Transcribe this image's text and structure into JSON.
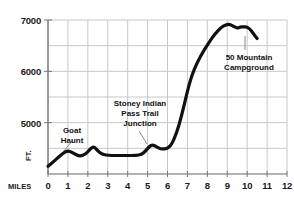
{
  "chart_data": {
    "type": "line",
    "title": "",
    "subtitle": "",
    "xlabel": "MILES",
    "ylabel": "FT.",
    "xlim": [
      0,
      12
    ],
    "ylim": [
      4000,
      7000
    ],
    "grid": true,
    "legend": null,
    "x_ticks": [
      "0",
      "1",
      "2",
      "3",
      "4",
      "5",
      "6",
      "7",
      "8",
      "9",
      "10",
      "11",
      "12"
    ],
    "x_tick_values": [
      0,
      1,
      2,
      3,
      4,
      5,
      6,
      7,
      8,
      9,
      10,
      11,
      12
    ],
    "y_ticks": [
      "5000",
      "6000",
      "7000"
    ],
    "y_tick_values": [
      5000,
      6000,
      7000
    ],
    "y_minor_gridlines": [
      4500,
      5500,
      6500
    ],
    "line_color": "#111111",
    "grid_color": "#c8c8c8",
    "series": [
      {
        "name": "Elevation profile",
        "x": [
          0.0,
          0.25,
          0.5,
          0.75,
          1.0,
          1.3,
          1.6,
          1.9,
          2.1,
          2.3,
          2.5,
          2.7,
          2.9,
          3.2,
          3.6,
          4.0,
          4.4,
          4.7,
          4.9,
          5.1,
          5.25,
          5.45,
          5.65,
          5.85,
          6.0,
          6.2,
          6.45,
          6.7,
          6.95,
          7.2,
          7.5,
          7.8,
          8.1,
          8.4,
          8.7,
          8.9,
          9.1,
          9.3,
          9.5,
          9.65,
          9.8,
          10.0,
          10.15,
          10.3,
          10.5
        ],
        "y": [
          4150,
          4230,
          4320,
          4400,
          4460,
          4400,
          4340,
          4390,
          4480,
          4540,
          4450,
          4390,
          4370,
          4360,
          4360,
          4360,
          4360,
          4380,
          4450,
          4540,
          4570,
          4530,
          4490,
          4490,
          4500,
          4570,
          4790,
          5120,
          5530,
          5910,
          6180,
          6390,
          6570,
          6740,
          6860,
          6900,
          6920,
          6880,
          6840,
          6860,
          6870,
          6860,
          6820,
          6740,
          6640
        ]
      }
    ],
    "annotations": [
      {
        "id": "goat-haunt",
        "lines": [
          "Goat",
          "Haunt"
        ],
        "text_x": 72,
        "text_y": 126,
        "leader": {
          "x1": 63,
          "y1": 152,
          "x2": 73,
          "y2": 140
        }
      },
      {
        "id": "stoney-indian-pass-trail-junction",
        "lines": [
          "Stoney Indian",
          "Pass Trail",
          "Junction"
        ],
        "text_x": 140,
        "text_y": 99,
        "leader": {
          "x1": 147,
          "y1": 144,
          "x2": 139,
          "y2": 131
        }
      },
      {
        "id": "50-mountain-campground",
        "lines": [
          "50 Mountain",
          "Campground"
        ],
        "text_x": 249,
        "text_y": 53,
        "leader": {
          "x1": 245,
          "y1": 36,
          "x2": 245,
          "y2": 50
        }
      }
    ]
  },
  "geometry": {
    "plot_left": 48,
    "plot_right": 287,
    "plot_top": 20,
    "plot_bottom": 174,
    "x_min": 0,
    "x_max": 12,
    "y_min": 4000,
    "y_max": 7000
  },
  "axis_labels": {
    "x_unit": "MILES",
    "y_unit": "FT."
  }
}
